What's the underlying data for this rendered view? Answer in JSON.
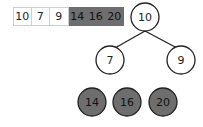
{
  "array": {
    "cells": [
      {
        "value": "10",
        "state": "heap"
      },
      {
        "value": "7",
        "state": "heap"
      },
      {
        "value": "9",
        "state": "heap"
      },
      {
        "value": "14",
        "state": "sorted"
      },
      {
        "value": "16",
        "state": "sorted"
      },
      {
        "value": "20",
        "state": "sorted"
      }
    ]
  },
  "tree": {
    "root": {
      "value": "10"
    },
    "left": {
      "value": "7"
    },
    "right": {
      "value": "9"
    }
  },
  "sorted_nodes": [
    {
      "value": "14"
    },
    {
      "value": "16"
    },
    {
      "value": "20"
    }
  ],
  "colors": {
    "sorted_fill": "#6e6e6e",
    "heap_fill": "#ffffff",
    "stroke": "#222222"
  }
}
